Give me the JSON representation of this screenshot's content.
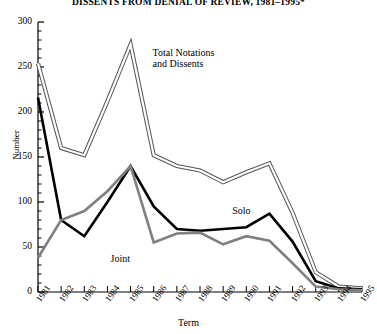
{
  "chart_data": {
    "type": "line",
    "title": "DISSENTS FROM DENIAL OF REVIEW, 1981–1995*",
    "xlabel": "Term",
    "ylabel": "Number",
    "categories": [
      "1981",
      "1982",
      "1983",
      "1984",
      "1985",
      "1986",
      "1987",
      "1988",
      "1989",
      "1990",
      "1991",
      "1992",
      "1993",
      "1994",
      "1995"
    ],
    "xlim": [
      1981,
      1995
    ],
    "ylim": [
      0,
      300
    ],
    "yticks": [
      0,
      50,
      100,
      150,
      200,
      250,
      300
    ],
    "minor_yticks": true,
    "grid": false,
    "legend": "inline-annotations",
    "series": [
      {
        "name": "Total Notations and Dissents",
        "label": "Total Notations\nand Dissents",
        "style": "hollow-double-line",
        "color": "#555555",
        "values": [
          254,
          160,
          152,
          212,
          275,
          152,
          140,
          135,
          122,
          133,
          143,
          88,
          22,
          6,
          4
        ]
      },
      {
        "name": "Solo",
        "label": "Solo",
        "style": "solid-thick",
        "color": "#000000",
        "values": [
          216,
          80,
          62,
          100,
          140,
          95,
          70,
          68,
          70,
          72,
          87,
          56,
          12,
          4,
          3
        ]
      },
      {
        "name": "Joint",
        "label": "Joint",
        "style": "solid-thick",
        "color": "#808080",
        "values": [
          38,
          80,
          90,
          112,
          140,
          55,
          65,
          66,
          53,
          62,
          57,
          32,
          6,
          3,
          2
        ]
      }
    ],
    "annotations": [
      {
        "text": "Total Notations",
        "series": "Total Notations and Dissents"
      },
      {
        "text": "and Dissents",
        "series": "Total Notations and Dissents"
      },
      {
        "text": "Solo",
        "series": "Solo"
      },
      {
        "text": "Joint",
        "series": "Joint"
      }
    ]
  },
  "labels": {
    "total_line1": "Total Notations",
    "total_line2": "and Dissents",
    "solo": "Solo",
    "joint": "Joint"
  }
}
